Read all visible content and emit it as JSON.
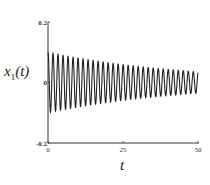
{
  "chart_data": {
    "type": "line",
    "title": "",
    "xlabel": "t",
    "ylabel": "x_1(t)",
    "ylabel_display": {
      "base": "x",
      "sub": "1",
      "rest": "(t)"
    },
    "xlim": [
      0,
      50
    ],
    "ylim": [
      -0.2,
      0.2
    ],
    "x_ticks": [
      0,
      25,
      50
    ],
    "x_tick_labels": [
      "0",
      "25",
      "50"
    ],
    "y_ticks": [
      -0.2,
      0,
      0.2
    ],
    "y_tick_labels": [
      "-0.2",
      "0",
      "0.2"
    ],
    "grid": false,
    "legend": null,
    "series": [
      {
        "name": "x_1(t)",
        "description": "Decaying oscillation",
        "model": "A(t)*sin(2*pi*t/T)",
        "initial_amplitude": 0.1,
        "final_amplitude": 0.035,
        "approx_cycles": 30,
        "period": 1.67,
        "color": "#222222"
      }
    ],
    "envelope_samples": {
      "t": [
        0,
        5,
        10,
        15,
        20,
        25,
        30,
        35,
        40,
        45,
        50
      ],
      "amplitude": [
        0.1,
        0.09,
        0.082,
        0.074,
        0.067,
        0.06,
        0.054,
        0.049,
        0.044,
        0.039,
        0.035
      ]
    }
  }
}
